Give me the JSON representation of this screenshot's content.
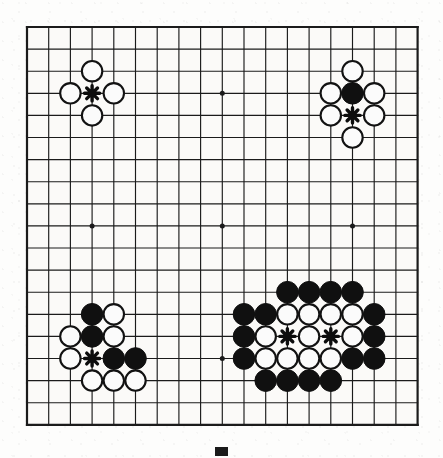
{
  "figure": {
    "kind": "go-board-diagram",
    "board_size": 19,
    "colors": {
      "line": "#1b1b1b",
      "black_stone": "#101010",
      "white_stone_fill": "#fbfbfb",
      "white_stone_edge": "#121212",
      "board_background": "#fbfaf8",
      "mark": "#0d0d0d",
      "page_background": "#ffffff"
    },
    "geometry": {
      "origin_x": 27,
      "origin_y": 27,
      "spacing_x": 21.7,
      "spacing_y": 22.1,
      "stone_radius": 10.2,
      "border_width": 2.2,
      "line_width": 1.15
    },
    "star_points": [
      {
        "col": 3,
        "row": 3
      },
      {
        "col": 9,
        "row": 3
      },
      {
        "col": 15,
        "row": 3
      },
      {
        "col": 3,
        "row": 9
      },
      {
        "col": 9,
        "row": 9
      },
      {
        "col": 15,
        "row": 9
      },
      {
        "col": 3,
        "row": 15
      },
      {
        "col": 9,
        "row": 15
      },
      {
        "col": 15,
        "row": 15
      }
    ],
    "groups": [
      {
        "name": "top-left-corner-group",
        "label": "White surrounding a marked empty point at the 4-4 star",
        "black_stones": [],
        "white_stones": [
          {
            "col": 3,
            "row": 2
          },
          {
            "col": 2,
            "row": 3
          },
          {
            "col": 4,
            "row": 3
          },
          {
            "col": 3,
            "row": 4
          }
        ],
        "marks": [
          {
            "col": 3,
            "row": 3,
            "glyph": "asterisk"
          }
        ]
      },
      {
        "name": "top-right-corner-group",
        "label": "White surrounding one black stone and a marked empty point",
        "black_stones": [
          {
            "col": 15,
            "row": 3
          }
        ],
        "white_stones": [
          {
            "col": 15,
            "row": 2
          },
          {
            "col": 14,
            "row": 3
          },
          {
            "col": 16,
            "row": 3
          },
          {
            "col": 14,
            "row": 4
          },
          {
            "col": 16,
            "row": 4
          },
          {
            "col": 15,
            "row": 5
          }
        ],
        "marks": [
          {
            "col": 15,
            "row": 4,
            "glyph": "asterisk"
          }
        ]
      },
      {
        "name": "bottom-left-corner-group",
        "label": "Mixed black and white shape around a marked empty point near the 4-4 star",
        "black_stones": [
          {
            "col": 3,
            "row": 13
          },
          {
            "col": 3,
            "row": 14
          },
          {
            "col": 4,
            "row": 15
          },
          {
            "col": 5,
            "row": 15
          }
        ],
        "white_stones": [
          {
            "col": 4,
            "row": 13
          },
          {
            "col": 2,
            "row": 14
          },
          {
            "col": 4,
            "row": 14
          },
          {
            "col": 2,
            "row": 15
          },
          {
            "col": 3,
            "row": 16
          },
          {
            "col": 4,
            "row": 16
          },
          {
            "col": 5,
            "row": 16
          }
        ],
        "marks": [
          {
            "col": 3,
            "row": 15,
            "glyph": "asterisk"
          }
        ]
      },
      {
        "name": "right-side-large-group",
        "label": "Large white group enclosed by black with two marked empty points",
        "black_stones": [
          {
            "col": 12,
            "row": 12
          },
          {
            "col": 13,
            "row": 12
          },
          {
            "col": 14,
            "row": 12
          },
          {
            "col": 15,
            "row": 12
          },
          {
            "col": 10,
            "row": 13
          },
          {
            "col": 11,
            "row": 13
          },
          {
            "col": 16,
            "row": 13
          },
          {
            "col": 10,
            "row": 14
          },
          {
            "col": 16,
            "row": 14
          },
          {
            "col": 10,
            "row": 15
          },
          {
            "col": 15,
            "row": 15
          },
          {
            "col": 16,
            "row": 15
          },
          {
            "col": 11,
            "row": 16
          },
          {
            "col": 12,
            "row": 16
          },
          {
            "col": 13,
            "row": 16
          },
          {
            "col": 14,
            "row": 16
          }
        ],
        "white_stones": [
          {
            "col": 12,
            "row": 13
          },
          {
            "col": 13,
            "row": 13
          },
          {
            "col": 14,
            "row": 13
          },
          {
            "col": 15,
            "row": 13
          },
          {
            "col": 11,
            "row": 14
          },
          {
            "col": 13,
            "row": 14
          },
          {
            "col": 15,
            "row": 14
          },
          {
            "col": 11,
            "row": 15
          },
          {
            "col": 12,
            "row": 15
          },
          {
            "col": 13,
            "row": 15
          },
          {
            "col": 14,
            "row": 15
          }
        ],
        "marks": [
          {
            "col": 12,
            "row": 14,
            "glyph": "asterisk"
          },
          {
            "col": 14,
            "row": 14,
            "glyph": "asterisk"
          }
        ]
      }
    ],
    "footer": {
      "mark": "solid-black-rectangle"
    }
  }
}
